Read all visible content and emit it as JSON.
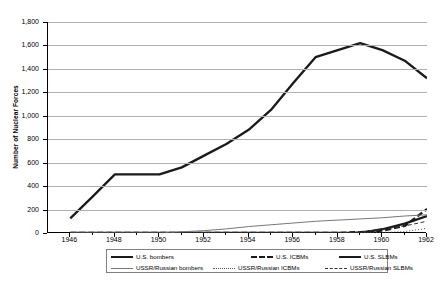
{
  "chart_data": {
    "type": "line",
    "title": "",
    "xlabel": "",
    "ylabel": "Number of Nuclear Forces",
    "xlim": [
      1945,
      1962
    ],
    "ylim": [
      0,
      1800
    ],
    "ytick_step": 200,
    "grid": true,
    "legend_position": "bottom",
    "x": [
      1946,
      1947,
      1948,
      1949,
      1950,
      1951,
      1952,
      1953,
      1954,
      1955,
      1956,
      1957,
      1958,
      1959,
      1960,
      1961,
      1962
    ],
    "yticks": [
      "0",
      "200",
      "400",
      "600",
      "800",
      "1,000",
      "1,200",
      "1,400",
      "1,600",
      "1,800"
    ],
    "xticks": [
      "1946",
      "1948",
      "1950",
      "1952",
      "1954",
      "1956",
      "1958",
      "1960",
      "1962"
    ],
    "series": [
      {
        "name": "U.S. bombers",
        "style": "solid-thick",
        "color": "#1a1a1a",
        "values": [
          125,
          310,
          500,
          500,
          500,
          560,
          660,
          760,
          880,
          1050,
          1280,
          1500,
          1560,
          1620,
          1560,
          1470,
          1320
        ]
      },
      {
        "name": "U.S. ICBMs",
        "style": "dash-thick",
        "color": "#1a1a1a",
        "values": [
          0,
          0,
          0,
          0,
          0,
          0,
          0,
          0,
          0,
          0,
          0,
          0,
          0,
          8,
          20,
          60,
          205
        ]
      },
      {
        "name": "U.S. SLBMs",
        "style": "solid-thick-short",
        "color": "#1a1a1a",
        "values": [
          0,
          0,
          0,
          0,
          0,
          0,
          0,
          0,
          0,
          0,
          0,
          0,
          0,
          0,
          32,
          80,
          145
        ]
      },
      {
        "name": "USSR/Russian bombers",
        "style": "solid-thin",
        "color": "#777777",
        "values": [
          0,
          0,
          0,
          0,
          0,
          10,
          20,
          35,
          55,
          70,
          85,
          100,
          110,
          120,
          130,
          145,
          155
        ]
      },
      {
        "name": "USSR/Russian ICBMs",
        "style": "dot-thin",
        "color": "#555555",
        "values": [
          0,
          0,
          0,
          0,
          0,
          0,
          0,
          0,
          0,
          0,
          0,
          0,
          0,
          2,
          5,
          12,
          40
        ]
      },
      {
        "name": "USSR/Russian SLBMs",
        "style": "dash-thin",
        "color": "#333333",
        "values": [
          0,
          0,
          0,
          0,
          0,
          0,
          0,
          0,
          0,
          0,
          0,
          0,
          0,
          10,
          30,
          60,
          100
        ]
      }
    ]
  },
  "legend": {
    "entries": [
      {
        "label": "U.S. bombers",
        "key": "solid-thick"
      },
      {
        "label": "U.S. ICBMs",
        "key": "dash-thick"
      },
      {
        "label": "U.S. SLBMs",
        "key": "solid-thick"
      },
      {
        "label": "USSR/Russian bombers",
        "key": "solid-thin"
      },
      {
        "label": "USSR/Russian ICBMs",
        "key": "dot-thin"
      },
      {
        "label": "USSR/Russian SLBMs",
        "key": "dash-thin"
      }
    ]
  }
}
